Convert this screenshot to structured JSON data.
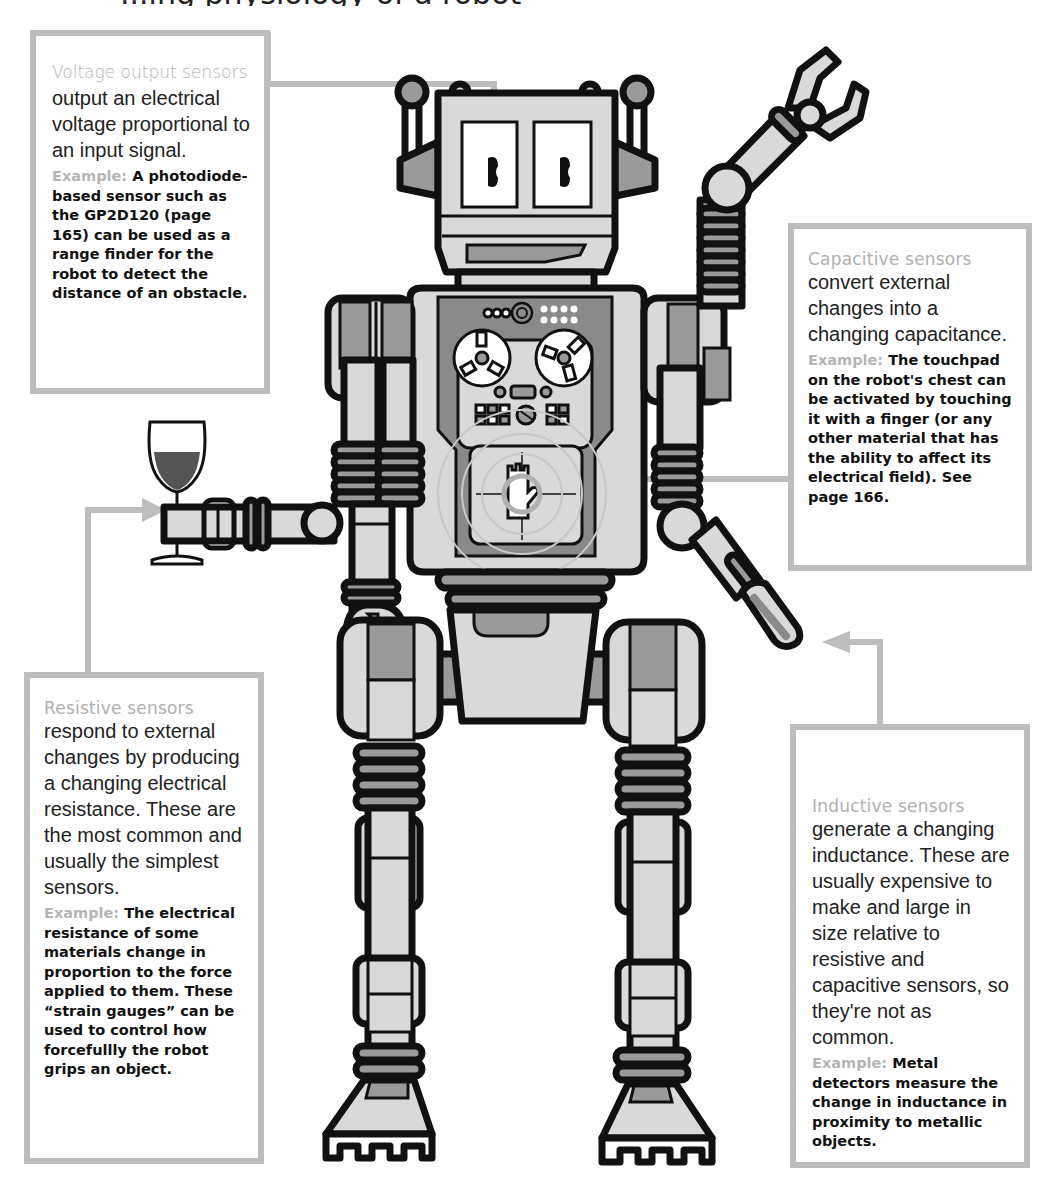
{
  "title_fragment": "...ing physiology of a robot",
  "callouts": {
    "voltage": {
      "heading": "Voltage output sensors",
      "body": "output an electrical voltage proportional to an input signal.",
      "example_label": "Example:",
      "example_text": "A photodiode-based sensor such as the GP2D120 (page 165) can be used as a range finder for the robot to detect the distance of an obstacle.",
      "points_to": "robot eyes"
    },
    "capacitive": {
      "heading": "Capacitive sensors",
      "body": "convert external changes into a changing capacitance.",
      "example_label": "Example:",
      "example_text": "The touchpad on the robot's chest can be activated by touching it with a finger (or any other material that has the ability to affect its electrical field). See page 166.",
      "points_to": "chest touchpad"
    },
    "resistive": {
      "heading": "Resistive sensors",
      "body": "respond to external changes by producing a changing electrical resistance. These are the most common and usually the simplest sensors.",
      "example_label": "Example:",
      "example_text": "The electrical resistance of some materials change in proportion to the force applied to them. These “strain gauges” can be used to control how forcefullly the robot grips an object.",
      "points_to": "gripping hand holding wine glass"
    },
    "inductive": {
      "heading": "Inductive sensors",
      "body": "generate a changing inductance. These are usually expensive to make and large in size relative to resistive and capacitive sensors, so they're not as common.",
      "example_label": "Example:",
      "example_text": "Metal detectors measure the change in inductance in proximity to metallic objects.",
      "points_to": "probe arm tip"
    }
  },
  "colors": {
    "outline": "#111111",
    "light_fill": "#d9d9d9",
    "mid_fill": "#9a9a9a",
    "dark_fill": "#7a7a7a",
    "callout_border": "#bdbdbd",
    "heading_gray": "#b0b0b0",
    "wine": "#555555"
  }
}
